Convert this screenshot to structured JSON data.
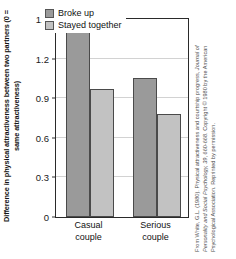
{
  "chart_data": {
    "type": "bar",
    "title": "",
    "categories": [
      "Casual couple",
      "Serious couple"
    ],
    "series": [
      {
        "name": "Broke up",
        "values": [
          1.48,
          1.05
        ],
        "color": "#9a9a9a"
      },
      {
        "name": "Stayed together",
        "values": [
          0.97,
          0.78
        ],
        "color": "#c2c2c2"
      }
    ],
    "xlabel": "",
    "ylabel": "Difference in physical attractiveness between two partners (0 = same attractiveness)",
    "ylim": [
      0,
      1.5
    ],
    "yticks": [
      "0",
      "0.3",
      "0.6",
      "0.9",
      "1.2",
      "1.5"
    ],
    "ytick_values": [
      0,
      0.3,
      0.6,
      0.9,
      1.2,
      1.5
    ],
    "grid": true,
    "legend_position": "top-center"
  },
  "axis": {
    "y_title": "Difference in physical attractiveness between two partners (0 = same attractiveness)",
    "x_categories": [
      {
        "line1": "Casual",
        "line2": "couple"
      },
      {
        "line1": "Serious",
        "line2": "couple"
      }
    ]
  },
  "legend": {
    "items": [
      {
        "label": "Broke up"
      },
      {
        "label": "Stayed together"
      }
    ]
  },
  "credit": {
    "line1": "From White, G.L. (1980). Physical attractiveness and courtship progress, Journal of",
    "line2": "Personality and Social Psychology, 39, 660-668. Copyright © 1980 by the American",
    "line3": "Psychological Association. Reprinted by permission."
  },
  "colors": {
    "series_broke_up": "#9a9a9a",
    "series_stayed_together": "#c2c2c2",
    "grid": "#d2d2d2",
    "frame": "#2a2a2a",
    "text": "#111111",
    "credit_text": "#4e4e4e"
  }
}
